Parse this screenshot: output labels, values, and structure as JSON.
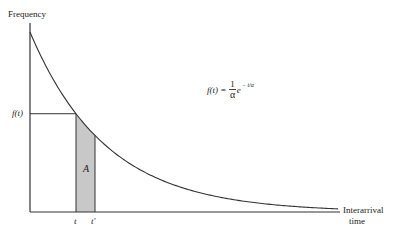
{
  "chart_data": {
    "type": "line",
    "title": "",
    "ylabel": "Frequency",
    "xlabel_lines": [
      "Interarrival",
      "time"
    ],
    "formula": {
      "lhs": "f(t) =",
      "numerator": "1",
      "denominator": "α",
      "base": "e",
      "exponent": "− t/α"
    },
    "y_marker_label": "f(t)",
    "x_tick_labels": [
      "t",
      "t′"
    ],
    "shaded_region": {
      "label": "A",
      "x_from": "t",
      "x_to": "t′",
      "fill": "#c8c8c8"
    },
    "curve": {
      "description": "Exponential decay density f(t) = (1/α) e^(−t/α)",
      "x": [
        0,
        0.5,
        1,
        1.5,
        2,
        2.5,
        3,
        3.5,
        4
      ],
      "y": [
        1.0,
        0.607,
        0.368,
        0.223,
        0.135,
        0.082,
        0.05,
        0.03,
        0.018
      ]
    },
    "grid": false,
    "legend": null,
    "colors": {
      "axis": "#333333",
      "curve": "#333333",
      "shade": "#c8c8c8"
    }
  }
}
